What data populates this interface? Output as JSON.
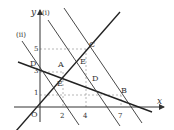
{
  "diagram": {
    "axes": {
      "x_label": "x",
      "y_label": "y",
      "origin_label": "O"
    },
    "x_ticks": [
      "2",
      "4",
      "7"
    ],
    "y_ticks": [
      "1",
      "3",
      "5"
    ],
    "line_labels": {
      "line_i": "(i)",
      "line_ii": "(ii)"
    },
    "points": {
      "A": "A",
      "B": "B",
      "C": "C",
      "D_left": "D",
      "D_right": "D",
      "E_upper": "E",
      "E_lower": "E"
    },
    "colors": {
      "line": "#222222",
      "dashed": "#888888",
      "axis": "#333333"
    }
  }
}
